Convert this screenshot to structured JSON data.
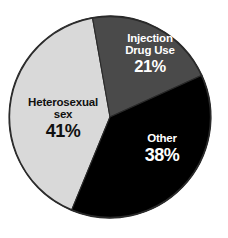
{
  "chart_data": {
    "type": "pie",
    "title": "",
    "subtitle": "",
    "xlabel": "",
    "ylabel": "",
    "units": "percent",
    "legend_position": "none",
    "grid": false,
    "labels_inside_slices": true,
    "start_angle_deg_from_north": -10,
    "direction": "clockwise",
    "categories": [
      "Injection Drug Use",
      "Other",
      "Heterosexual sex"
    ],
    "values": [
      21,
      38,
      41
    ],
    "value_labels": [
      "21%",
      "38%",
      "41%"
    ],
    "colors": [
      "#4a4a4a",
      "#000000",
      "#d9d9d9"
    ],
    "label_text_colors": [
      "#ffffff",
      "#ffffff",
      "#101010"
    ],
    "slices": [
      {
        "name": "Injection Drug Use",
        "name_line1": "Injection",
        "name_line2": "Drug Use",
        "value": 21,
        "value_label": "21%",
        "color": "#4a4a4a",
        "text_color": "#ffffff",
        "sweep_deg": 75.6
      },
      {
        "name": "Other",
        "name_line1": "Other",
        "name_line2": "",
        "value": 38,
        "value_label": "38%",
        "color": "#000000",
        "text_color": "#ffffff",
        "sweep_deg": 136.8
      },
      {
        "name": "Heterosexual sex",
        "name_line1": "Heterosexual",
        "name_line2": "sex",
        "value": 41,
        "value_label": "41%",
        "color": "#d9d9d9",
        "text_color": "#101010",
        "sweep_deg": 147.6
      }
    ]
  },
  "figure": {
    "background_color": "#ffffff",
    "outline_color": "#2a2a2a",
    "center_x": 110,
    "center_y": 117,
    "radius": 101
  }
}
